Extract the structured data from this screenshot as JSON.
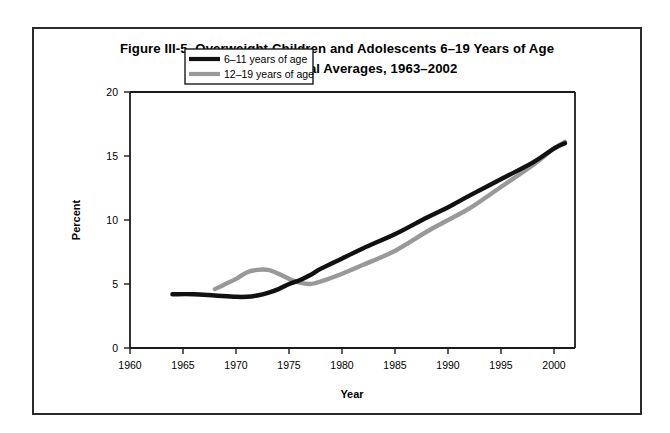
{
  "figure": {
    "title_line1": "Figure III-5. Overweight Children and Adolescents 6–19 Years of Age",
    "title_line2": "Selected Annual Averages, 1963–2002"
  },
  "colors": {
    "series_6_11": "#111111",
    "series_12_19": "#999999",
    "axis": "#1a1a1a",
    "frame": "#2b2b2b",
    "background": "#ffffff"
  },
  "chart_data": {
    "type": "line",
    "title": "Figure III-5. Overweight Children and Adolescents 6–19 Years of Age Selected Annual Averages, 1963–2002",
    "xlabel": "Year",
    "ylabel": "Percent",
    "xlim": [
      1960,
      2002
    ],
    "ylim": [
      0,
      20
    ],
    "xticks": [
      1960,
      1965,
      1970,
      1975,
      1980,
      1985,
      1990,
      1995,
      2000
    ],
    "xtick_labels": [
      "1960",
      "1965",
      "1970",
      "1975",
      "1980",
      "1985",
      "1990",
      "1995",
      "2000"
    ],
    "yticks": [
      0,
      5,
      10,
      15,
      20
    ],
    "ytick_labels": [
      "0",
      "5",
      "10",
      "15",
      "20"
    ],
    "grid": false,
    "legend_position": "top-center-inside",
    "series": [
      {
        "name": "6–11 years of age",
        "color": "#111111",
        "x": [
          1964,
          1966,
          1968,
          1970,
          1971,
          1972,
          1973,
          1974,
          1975,
          1976,
          1977,
          1978,
          1980,
          1982,
          1985,
          1988,
          1990,
          1992,
          1995,
          1998,
          2000,
          2001
        ],
        "values": [
          4.2,
          4.2,
          4.1,
          4.0,
          4.0,
          4.1,
          4.3,
          4.6,
          5.0,
          5.3,
          5.7,
          6.2,
          7.0,
          7.8,
          8.9,
          10.2,
          11.0,
          11.9,
          13.2,
          14.5,
          15.6,
          16.0
        ]
      },
      {
        "name": "12–19 years of age",
        "color": "#999999",
        "x": [
          1968,
          1969,
          1970,
          1971,
          1972,
          1973,
          1974,
          1975,
          1976,
          1977,
          1978,
          1980,
          1982,
          1985,
          1988,
          1990,
          1992,
          1995,
          1998,
          2000,
          2001
        ],
        "values": [
          4.6,
          5.0,
          5.4,
          5.9,
          6.1,
          6.1,
          5.8,
          5.4,
          5.1,
          5.0,
          5.2,
          5.8,
          6.5,
          7.6,
          9.1,
          10.0,
          10.9,
          12.6,
          14.3,
          15.6,
          16.1
        ]
      }
    ]
  },
  "legend": {
    "items": [
      {
        "label": "6–11 years of age",
        "color": "#111111"
      },
      {
        "label": "12–19 years of age",
        "color": "#999999"
      }
    ]
  }
}
